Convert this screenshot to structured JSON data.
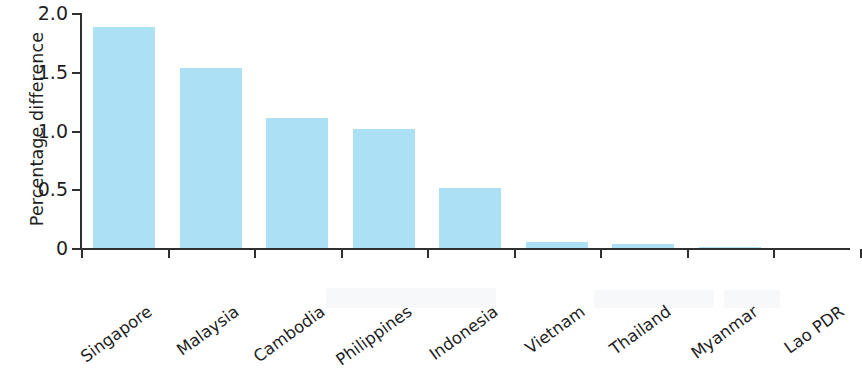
{
  "chart_data": {
    "type": "bar",
    "title": "",
    "xlabel": "",
    "ylabel": "Percentage difference",
    "categories": [
      "Singapore",
      "Malaysia",
      "Cambodia",
      "Philippines",
      "Indonesia",
      "Vietnam",
      "Thailand",
      "Myanmar",
      "Lao PDR"
    ],
    "values": [
      1.88,
      1.53,
      1.11,
      1.01,
      0.51,
      0.05,
      0.03,
      0.01,
      0.0
    ],
    "ylim": [
      0,
      2.0
    ],
    "yticks": [
      "0",
      "0.5",
      "1.0",
      "1.5",
      "2.0"
    ],
    "ytick_values": [
      0,
      0.5,
      1.0,
      1.5,
      2.0
    ],
    "grid": false,
    "legend": false,
    "bar_color": "#ace0f5",
    "axis_color": "#303030"
  }
}
